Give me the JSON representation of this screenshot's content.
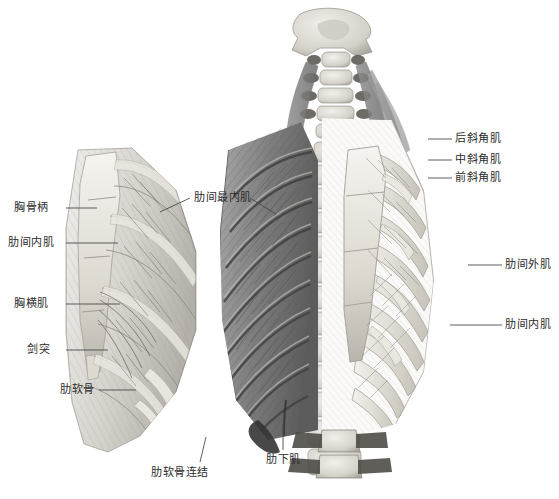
{
  "figure": {
    "background_color": "#ffffff",
    "label_color": "#2b2b2b",
    "leader_color": "#4a4a4a",
    "bone_color": "#e8e6e0",
    "muscle_color": "#8d8d8d",
    "shadow_color": "#5a5a5a"
  },
  "panels": [
    {
      "name": "left-panel",
      "description": "Inner (posterior) view of the anterior chest wall, left side, showing transversus thoracis and internal intercostals"
    },
    {
      "name": "main-panel",
      "description": "Posterior view of the thoracic cage: left half dissected to deep muscle layer, right half showing ribs, sternum and costal cartilages"
    }
  ],
  "labels": [
    {
      "id": "manubrium",
      "text": "胸骨柄",
      "side": "left",
      "x": 14,
      "y": 202,
      "line": [
        [
          66,
          208
        ],
        [
          97,
          208
        ]
      ]
    },
    {
      "id": "internal-intercostal-left",
      "text": "肋间内肌",
      "side": "left",
      "x": 8,
      "y": 237,
      "line": [
        [
          66,
          243
        ],
        [
          118,
          243
        ]
      ]
    },
    {
      "id": "transversus-thoracis",
      "text": "胸横肌",
      "side": "left",
      "x": 14,
      "y": 298,
      "line": [
        [
          66,
          304
        ],
        [
          120,
          304
        ]
      ]
    },
    {
      "id": "xiphoid-process",
      "text": "剑突",
      "side": "left",
      "x": 27,
      "y": 344,
      "line": [
        [
          66,
          350
        ],
        [
          108,
          350
        ]
      ]
    },
    {
      "id": "costal-cartilage",
      "text": "肋软骨",
      "side": "left",
      "x": 60,
      "y": 384,
      "line": [
        [
          99,
          390
        ],
        [
          136,
          390
        ]
      ]
    },
    {
      "id": "innermost-intercostal",
      "text": "肋间最内肌",
      "side": "center",
      "x": 194,
      "y": 192,
      "line": [
        [
          190,
          198
        ],
        [
          160,
          212
        ]
      ],
      "line2": [
        [
          250,
          198
        ],
        [
          276,
          214
        ]
      ]
    },
    {
      "id": "costochondral-joint",
      "text": "肋软骨连结",
      "side": "center",
      "x": 151,
      "y": 467,
      "line": [
        [
          200,
          462
        ],
        [
          206,
          437
        ]
      ]
    },
    {
      "id": "subcostal",
      "text": "肋下肌",
      "side": "center",
      "x": 266,
      "y": 454,
      "line": [
        [
          283,
          450
        ],
        [
          283,
          424
        ]
      ]
    },
    {
      "id": "posterior-scalene",
      "text": "后斜角肌",
      "side": "right",
      "x": 455,
      "y": 133,
      "line": [
        [
          428,
          139
        ],
        [
          452,
          139
        ]
      ]
    },
    {
      "id": "middle-scalene",
      "text": "中斜角肌",
      "side": "right",
      "x": 455,
      "y": 154,
      "line": [
        [
          428,
          160
        ],
        [
          452,
          160
        ]
      ]
    },
    {
      "id": "anterior-scalene",
      "text": "前斜角肌",
      "side": "right",
      "x": 455,
      "y": 172,
      "line": [
        [
          428,
          178
        ],
        [
          452,
          178
        ]
      ]
    },
    {
      "id": "external-intercostal",
      "text": "肋间外肌",
      "side": "right",
      "x": 505,
      "y": 259,
      "line": [
        [
          468,
          265
        ],
        [
          502,
          265
        ]
      ]
    },
    {
      "id": "internal-intercostal-right",
      "text": "肋间内肌",
      "side": "right",
      "x": 505,
      "y": 319,
      "line": [
        [
          450,
          325
        ],
        [
          502,
          325
        ]
      ]
    }
  ]
}
